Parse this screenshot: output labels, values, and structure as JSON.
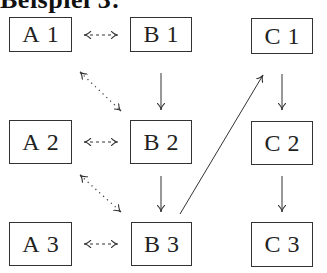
{
  "heading": "Beispiel 3:",
  "nodes": {
    "A1": {
      "letter": "A",
      "num": "1"
    },
    "B1": {
      "letter": "B",
      "num": "1"
    },
    "C1": {
      "letter": "C",
      "num": "1"
    },
    "A2": {
      "letter": "A",
      "num": "2"
    },
    "B2": {
      "letter": "B",
      "num": "2"
    },
    "C2": {
      "letter": "C",
      "num": "2"
    },
    "A3": {
      "letter": "A",
      "num": "3"
    },
    "B3": {
      "letter": "B",
      "num": "3"
    },
    "C3": {
      "letter": "C",
      "num": "3"
    }
  },
  "edges": [
    {
      "from": "A1",
      "to": "B1",
      "style": "dashed",
      "direction": "both"
    },
    {
      "from": "A2",
      "to": "B2",
      "style": "dashed",
      "direction": "both"
    },
    {
      "from": "A3",
      "to": "B3",
      "style": "dashed",
      "direction": "both"
    },
    {
      "from": "A1",
      "to": "B2",
      "style": "dotted",
      "direction": "both"
    },
    {
      "from": "A2",
      "to": "B3",
      "style": "dotted",
      "direction": "both"
    },
    {
      "from": "B1",
      "to": "B2",
      "style": "solid",
      "direction": "forward"
    },
    {
      "from": "B2",
      "to": "B3",
      "style": "solid",
      "direction": "forward"
    },
    {
      "from": "B3",
      "to": "C1",
      "style": "solid",
      "direction": "forward"
    },
    {
      "from": "C1",
      "to": "C2",
      "style": "solid",
      "direction": "forward"
    },
    {
      "from": "C2",
      "to": "C3",
      "style": "solid",
      "direction": "forward"
    }
  ],
  "colors": {
    "stroke": "#333333",
    "background": "#ffffff"
  }
}
